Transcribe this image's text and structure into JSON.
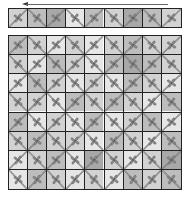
{
  "game": {
    "type": "tile-rotation-puzzle",
    "columns": 9,
    "rows": 8,
    "direction_indicator": "arrow-left"
  },
  "colors": {
    "grid_line": "#222222",
    "path": "#6e6e6e",
    "flower": "#8a8a8a",
    "flower_outline": "#555555",
    "tones": [
      "#e6e6e6",
      "#d2d2d2",
      "#bdbdbd",
      "#a8a8a8"
    ]
  },
  "strip": {
    "tiles": [
      {
        "tone": 1,
        "rot": 0
      },
      {
        "tone": 2,
        "rot": 90
      },
      {
        "tone": 3,
        "rot": 180
      },
      {
        "tone": 0,
        "rot": 270
      },
      {
        "tone": 2,
        "rot": 0
      },
      {
        "tone": 1,
        "rot": 90
      },
      {
        "tone": 3,
        "rot": 180
      },
      {
        "tone": 2,
        "rot": 270
      },
      {
        "tone": 1,
        "rot": 0
      }
    ]
  },
  "board": {
    "rows": [
      [
        {
          "tone": 2,
          "rot": 0
        },
        {
          "tone": 1,
          "rot": 90
        },
        {
          "tone": 0,
          "rot": 180
        },
        {
          "tone": 1,
          "rot": 270
        },
        {
          "tone": 0,
          "rot": 0
        },
        {
          "tone": 1,
          "rot": 90
        },
        {
          "tone": 2,
          "rot": 180
        },
        {
          "tone": 1,
          "rot": 270
        },
        {
          "tone": 1,
          "rot": 0
        }
      ],
      [
        {
          "tone": 1,
          "rot": 90
        },
        {
          "tone": 0,
          "rot": 180
        },
        {
          "tone": 2,
          "rot": 270
        },
        {
          "tone": 1,
          "rot": 0
        },
        {
          "tone": 0,
          "rot": 90
        },
        {
          "tone": 2,
          "rot": 180
        },
        {
          "tone": 3,
          "rot": 270
        },
        {
          "tone": 2,
          "rot": 0
        },
        {
          "tone": 1,
          "rot": 90
        }
      ],
      [
        {
          "tone": 0,
          "rot": 180
        },
        {
          "tone": 2,
          "rot": 270
        },
        {
          "tone": 1,
          "rot": 0
        },
        {
          "tone": 0,
          "rot": 90
        },
        {
          "tone": 1,
          "rot": 180
        },
        {
          "tone": 0,
          "rot": 270
        },
        {
          "tone": 2,
          "rot": 0
        },
        {
          "tone": 1,
          "rot": 90
        },
        {
          "tone": 0,
          "rot": 180
        }
      ],
      [
        {
          "tone": 1,
          "rot": 270
        },
        {
          "tone": 1,
          "rot": 0
        },
        {
          "tone": 0,
          "rot": 90
        },
        {
          "tone": 2,
          "rot": 180
        },
        {
          "tone": 1,
          "rot": 270
        },
        {
          "tone": 2,
          "rot": 0
        },
        {
          "tone": 1,
          "rot": 90
        },
        {
          "tone": 0,
          "rot": 180
        },
        {
          "tone": 2,
          "rot": 270
        }
      ],
      [
        {
          "tone": 2,
          "rot": 0
        },
        {
          "tone": 0,
          "rot": 90
        },
        {
          "tone": 1,
          "rot": 180
        },
        {
          "tone": 0,
          "rot": 270
        },
        {
          "tone": 2,
          "rot": 0
        },
        {
          "tone": 0,
          "rot": 90
        },
        {
          "tone": 1,
          "rot": 180
        },
        {
          "tone": 2,
          "rot": 270
        },
        {
          "tone": 0,
          "rot": 0
        }
      ],
      [
        {
          "tone": 1,
          "rot": 90
        },
        {
          "tone": 2,
          "rot": 180
        },
        {
          "tone": 1,
          "rot": 270
        },
        {
          "tone": 1,
          "rot": 0
        },
        {
          "tone": 0,
          "rot": 90
        },
        {
          "tone": 2,
          "rot": 180
        },
        {
          "tone": 1,
          "rot": 270
        },
        {
          "tone": 0,
          "rot": 0
        },
        {
          "tone": 2,
          "rot": 90
        }
      ],
      [
        {
          "tone": 0,
          "rot": 180
        },
        {
          "tone": 1,
          "rot": 270
        },
        {
          "tone": 2,
          "rot": 0
        },
        {
          "tone": 0,
          "rot": 90
        },
        {
          "tone": 3,
          "rot": 180
        },
        {
          "tone": 1,
          "rot": 270
        },
        {
          "tone": 0,
          "rot": 0
        },
        {
          "tone": 1,
          "rot": 90
        },
        {
          "tone": 3,
          "rot": 180
        }
      ],
      [
        {
          "tone": 0,
          "rot": 270
        },
        {
          "tone": 2,
          "rot": 0
        },
        {
          "tone": 1,
          "rot": 90
        },
        {
          "tone": 0,
          "rot": 180
        },
        {
          "tone": 1,
          "rot": 270
        },
        {
          "tone": 0,
          "rot": 0
        },
        {
          "tone": 2,
          "rot": 90
        },
        {
          "tone": 1,
          "rot": 180
        },
        {
          "tone": 2,
          "rot": 270
        }
      ]
    ]
  }
}
